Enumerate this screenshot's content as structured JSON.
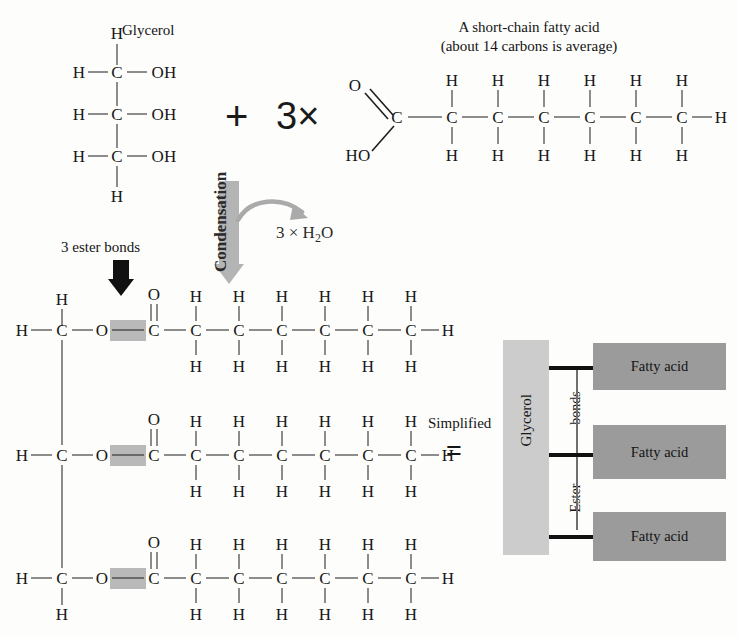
{
  "figure": {
    "type": "triglyceride-formation-diagram",
    "reactants": {
      "glycerol": {
        "label": "Glycerol",
        "backbone_atoms": [
          "C",
          "C",
          "C"
        ],
        "top_h": "H",
        "bottom_h": "H",
        "left_h": [
          "H",
          "H",
          "H"
        ],
        "hydroxyls": [
          "OH",
          "OH",
          "OH"
        ]
      },
      "plus": "+",
      "multiplier": "3×",
      "fatty_acid": {
        "title_line1": "A short-chain fatty acid",
        "title_line2": "(about 14 carbons is average)",
        "carboxyl_o": "O",
        "carboxyl_ho": "HO",
        "carboxyl_c": "C",
        "chain_carbons": [
          "C",
          "C",
          "C",
          "C",
          "C",
          "C"
        ],
        "upper_h": [
          "H",
          "H",
          "H",
          "H",
          "H",
          "H"
        ],
        "lower_h": [
          "H",
          "H",
          "H",
          "H",
          "H",
          "H"
        ],
        "terminal_h": "H"
      }
    },
    "reaction": {
      "arrow_label": "Condensation",
      "byproduct": "3 × H",
      "byproduct_sub": "2",
      "byproduct_tail": "O"
    },
    "product": {
      "callout_label": "3 ester bonds",
      "glycerol_left_h": [
        "H",
        "H",
        "H"
      ],
      "glycerol_backbone": [
        "C",
        "C",
        "C"
      ],
      "glycerol_top_h": "H",
      "glycerol_bottom_h": "H",
      "ester_o": "O",
      "carbonyl_o": "O",
      "carbonyl_c": "C",
      "chain_carbons": [
        "C",
        "C",
        "C",
        "C",
        "C",
        "C"
      ],
      "upper_h": [
        "H",
        "H",
        "H",
        "H",
        "H",
        "H"
      ],
      "lower_h": [
        "H",
        "H",
        "H",
        "H",
        "H",
        "H"
      ],
      "terminal_h": "H"
    },
    "simplified": {
      "word": "Simplified",
      "equals": "=",
      "glycerol_label": "Glycerol",
      "ester_label_lower": "Ester",
      "ester_label_upper": "bonds",
      "fatty_acid_boxes": [
        "Fatty acid",
        "Fatty acid",
        "Fatty acid"
      ]
    },
    "colors": {
      "ink": "#171717",
      "condensation_arrow": "#b4b4b4",
      "ester_highlight": "#b9b9b9",
      "glycerol_block": "#cccccc",
      "fatty_acid_block": "#9b9b9b",
      "background": "#fdfdfc"
    }
  }
}
